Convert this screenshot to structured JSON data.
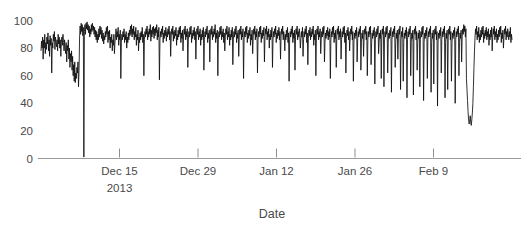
{
  "chart_data": {
    "type": "line",
    "title": "",
    "xlabel": "Date",
    "ylabel": "",
    "ylim": [
      0,
      105
    ],
    "yticks": [
      0,
      20,
      40,
      60,
      80,
      100
    ],
    "ytick_labels": [
      "0",
      "20",
      "40",
      "60",
      "80",
      "100"
    ],
    "xtick_labels": [
      "Dec 15",
      "Dec 29",
      "Jan 12",
      "Jan 26",
      "Feb 9"
    ],
    "xtick_sublabels": [
      "2013",
      "",
      "",
      "",
      ""
    ],
    "xtick_indices": [
      14,
      28,
      42,
      56,
      70
    ],
    "grid": false,
    "legend": null,
    "series": [
      {
        "name": "value",
        "color": "#0d0d0d",
        "x_index_start": 0,
        "values": [
          78,
          85,
          80,
          88,
          72,
          86,
          80,
          90,
          76,
          84,
          79,
          88,
          83,
          91,
          78,
          86,
          74,
          89,
          82,
          87,
          62,
          84,
          80,
          90,
          85,
          92,
          79,
          88,
          84,
          81,
          86,
          78,
          90,
          83,
          88,
          80,
          86,
          74,
          84,
          88,
          82,
          90,
          84,
          78,
          86,
          80,
          76,
          84,
          70,
          82,
          78,
          86,
          72,
          80,
          66,
          76,
          70,
          78,
          64,
          74,
          60,
          68,
          56,
          70,
          55,
          62,
          58,
          66,
          62,
          70,
          52,
          64,
          88,
          96,
          90,
          98,
          92,
          97,
          89,
          95,
          1,
          92,
          97,
          90,
          98,
          94,
          99,
          93,
          97,
          91,
          96,
          88,
          94,
          90,
          97,
          92,
          98,
          93,
          96,
          90,
          95,
          88,
          93,
          86,
          92,
          84,
          90,
          86,
          94,
          88,
          96,
          90,
          95,
          87,
          93,
          85,
          91,
          83,
          89,
          86,
          92,
          88,
          95,
          90,
          96,
          84,
          92,
          86,
          93,
          80,
          88,
          84,
          90,
          78,
          86,
          82,
          90,
          76,
          84,
          88,
          94,
          86,
          92,
          88,
          95,
          82,
          90,
          86,
          93,
          58,
          84,
          90,
          86,
          92,
          88,
          94,
          84,
          90,
          86,
          92,
          80,
          88,
          84,
          91,
          86,
          93,
          89,
          96,
          90,
          97,
          88,
          94,
          90,
          96,
          86,
          92,
          88,
          95,
          82,
          90,
          86,
          93,
          78,
          88,
          84,
          91,
          86,
          92,
          88,
          95,
          84,
          90,
          60,
          86,
          92,
          88,
          94,
          90,
          96,
          86,
          92,
          88,
          94,
          90,
          97,
          85,
          93,
          88,
          95,
          90,
          96,
          87,
          94,
          89,
          95,
          91,
          97,
          86,
          93,
          88,
          95,
          57,
          86,
          92,
          88,
          94,
          90,
          96,
          84,
          91,
          87,
          93,
          89,
          95,
          85,
          92,
          88,
          94,
          90,
          96,
          86,
          92,
          74,
          88,
          94,
          90,
          96,
          85,
          92,
          87,
          93,
          89,
          95,
          82,
          90,
          86,
          93,
          88,
          95,
          90,
          96,
          84,
          91,
          87,
          93,
          78,
          88,
          94,
          90,
          96,
          86,
          92,
          88,
          94,
          66,
          86,
          92,
          88,
          95,
          90,
          96,
          84,
          91,
          87,
          93,
          89,
          95,
          86,
          92,
          72,
          88,
          94,
          90,
          96,
          86,
          92,
          88,
          94,
          82,
          90,
          86,
          93,
          88,
          95,
          64,
          86,
          92,
          88,
          94,
          90,
          96,
          84,
          91,
          87,
          93,
          70,
          88,
          94,
          90,
          96,
          86,
          92,
          88,
          94,
          90,
          97,
          84,
          91,
          87,
          93,
          60,
          86,
          92,
          88,
          95,
          90,
          96,
          86,
          92,
          88,
          94,
          84,
          91,
          78,
          88,
          94,
          90,
          96,
          86,
          92,
          88,
          95,
          82,
          90,
          86,
          93,
          88,
          95,
          68,
          86,
          92,
          88,
          94,
          90,
          96,
          84,
          91,
          87,
          93,
          74,
          88,
          94,
          90,
          96,
          86,
          92,
          88,
          94,
          58,
          86,
          92,
          88,
          95,
          90,
          96,
          84,
          91,
          87,
          93,
          89,
          95,
          82,
          90,
          86,
          93,
          76,
          88,
          94,
          90,
          96,
          86,
          92,
          88,
          94,
          62,
          86,
          92,
          88,
          95,
          90,
          96,
          84,
          91,
          87,
          93,
          89,
          95,
          70,
          88,
          94,
          90,
          96,
          86,
          92,
          88,
          94,
          80,
          90,
          86,
          93,
          88,
          95,
          66,
          86,
          92,
          88,
          94,
          90,
          96,
          84,
          91,
          87,
          93,
          89,
          95,
          86,
          92,
          72,
          88,
          94,
          90,
          96,
          86,
          92,
          88,
          78,
          90,
          86,
          93,
          88,
          95,
          84,
          91,
          56,
          86,
          92,
          88,
          94,
          90,
          96,
          84,
          91,
          87,
          93,
          64,
          88,
          94,
          90,
          96,
          86,
          92,
          88,
          94,
          90,
          80,
          86,
          92,
          88,
          95,
          74,
          86,
          92,
          88,
          94,
          90,
          96,
          84,
          91,
          68,
          87,
          93,
          89,
          95,
          86,
          92,
          88,
          94,
          90,
          96,
          82,
          90,
          86,
          93,
          60,
          88,
          94,
          90,
          96,
          86,
          92,
          88,
          94,
          76,
          86,
          92,
          88,
          95,
          90,
          96,
          70,
          84,
          91,
          87,
          93,
          89,
          95,
          86,
          92,
          88,
          94,
          58,
          86,
          92,
          88,
          95,
          90,
          96,
          84,
          91,
          87,
          93,
          66,
          88,
          94,
          90,
          96,
          86,
          92,
          88,
          94,
          72,
          86,
          92,
          88,
          95,
          90,
          96,
          84,
          91,
          62,
          87,
          93,
          89,
          95,
          86,
          92,
          78,
          88,
          94,
          90,
          96,
          86,
          92,
          56,
          84,
          91,
          87,
          93,
          89,
          95,
          70,
          86,
          92,
          88,
          94,
          90,
          96,
          64,
          84,
          91,
          87,
          93,
          74,
          88,
          94,
          90,
          96,
          86,
          92,
          60,
          86,
          92,
          88,
          95,
          90,
          96,
          68,
          84,
          91,
          87,
          93,
          89,
          95,
          54,
          86,
          92,
          88,
          94,
          90,
          96,
          76,
          84,
          91,
          87,
          93,
          58,
          88,
          94,
          90,
          96,
          52,
          86,
          92,
          88,
          95,
          90,
          96,
          62,
          84,
          91,
          87,
          93,
          89,
          95,
          48,
          86,
          92,
          88,
          94,
          90,
          96,
          66,
          84,
          91,
          87,
          93,
          72,
          88,
          94,
          90,
          96,
          50,
          86,
          92,
          88,
          95,
          56,
          84,
          91,
          87,
          93,
          89,
          95,
          44,
          86,
          92,
          88,
          94,
          90,
          96,
          60,
          84,
          91,
          87,
          93,
          46,
          88,
          94,
          90,
          96,
          86,
          92,
          64,
          84,
          91,
          87,
          93,
          52,
          86,
          92,
          88,
          95,
          90,
          96,
          42,
          84,
          91,
          87,
          93,
          89,
          95,
          58,
          86,
          92,
          88,
          94,
          90,
          96,
          48,
          84,
          91,
          87,
          93,
          54,
          88,
          94,
          90,
          96,
          86,
          92,
          38,
          84,
          91,
          87,
          93,
          89,
          95,
          62,
          86,
          92,
          88,
          94,
          90,
          96,
          44,
          84,
          91,
          87,
          93,
          50,
          88,
          94,
          90,
          96,
          86,
          92,
          56,
          84,
          91,
          87,
          93,
          89,
          95,
          40,
          86,
          92,
          88,
          94,
          90,
          96,
          60,
          84,
          91,
          87,
          93,
          70,
          88,
          94,
          90,
          97,
          92,
          96,
          88,
          94,
          58,
          50,
          42,
          34,
          28,
          25,
          27,
          31,
          26,
          24,
          28,
          33,
          40,
          52,
          66,
          78,
          88,
          94,
          90,
          96,
          86,
          92,
          88,
          95,
          84,
          90,
          86,
          93,
          88,
          95,
          90,
          96,
          84,
          91,
          87,
          93,
          89,
          95,
          86,
          92,
          88,
          94,
          82,
          90,
          86,
          93,
          88,
          95,
          78,
          88,
          94,
          90,
          96,
          86,
          92,
          88,
          94,
          84,
          90,
          86,
          93,
          88,
          95,
          90,
          96,
          84,
          91,
          87,
          93,
          80,
          88,
          94,
          90,
          96,
          86,
          92,
          88,
          94,
          90,
          86,
          92,
          88,
          95,
          84,
          90,
          86
        ]
      }
    ]
  },
  "axes": {
    "x_axis_label": "Date",
    "y_axis_label": ""
  }
}
